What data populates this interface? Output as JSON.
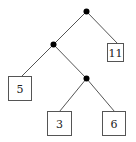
{
  "diagram": {
    "type": "binary-tree",
    "colors": {
      "edge": "#555555",
      "node": "#000000",
      "box_border": "#555555",
      "text": "#222222"
    },
    "internal_nodes": [
      {
        "id": "root",
        "x": 86,
        "y": 11
      },
      {
        "id": "n1",
        "x": 53,
        "y": 44
      },
      {
        "id": "n2",
        "x": 86,
        "y": 78
      }
    ],
    "leaves": [
      {
        "id": "leaf-11",
        "label": "11",
        "x": 107,
        "y": 43,
        "w": 16,
        "h": 18
      },
      {
        "id": "leaf-5",
        "label": "5",
        "x": 8,
        "y": 76,
        "w": 23,
        "h": 24
      },
      {
        "id": "leaf-3",
        "label": "3",
        "x": 47,
        "y": 111,
        "w": 24,
        "h": 24
      },
      {
        "id": "leaf-6",
        "label": "6",
        "x": 102,
        "y": 111,
        "w": 23,
        "h": 24
      }
    ],
    "edges": [
      {
        "from": "root",
        "to": "n1",
        "x1": 86,
        "y1": 11,
        "x2": 53,
        "y2": 44
      },
      {
        "from": "root",
        "to": "leaf-11",
        "x1": 86,
        "y1": 11,
        "x2": 117,
        "y2": 43
      },
      {
        "from": "n1",
        "to": "leaf-5",
        "x1": 53,
        "y1": 44,
        "x2": 21,
        "y2": 76
      },
      {
        "from": "n1",
        "to": "n2",
        "x1": 53,
        "y1": 44,
        "x2": 86,
        "y2": 78
      },
      {
        "from": "n2",
        "to": "leaf-3",
        "x1": 86,
        "y1": 78,
        "x2": 59,
        "y2": 111
      },
      {
        "from": "n2",
        "to": "leaf-6",
        "x1": 86,
        "y1": 78,
        "x2": 114,
        "y2": 111
      }
    ]
  }
}
